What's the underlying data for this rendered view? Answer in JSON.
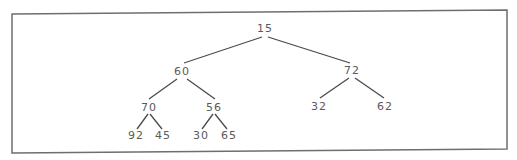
{
  "diagram": {
    "type": "binary-tree",
    "border_color": "#6e6e6e",
    "edge_color": "#4a4a4a",
    "text_color": "#5a5a5a",
    "nodes": [
      {
        "id": "n15",
        "label": "15",
        "x": 265,
        "y": 32
      },
      {
        "id": "n60",
        "label": "60",
        "x": 182,
        "y": 75
      },
      {
        "id": "n72",
        "label": "72",
        "x": 352,
        "y": 74
      },
      {
        "id": "n70",
        "label": "70",
        "x": 149,
        "y": 111
      },
      {
        "id": "n56",
        "label": "56",
        "x": 214,
        "y": 111
      },
      {
        "id": "n32",
        "label": "32",
        "x": 319,
        "y": 110
      },
      {
        "id": "n62",
        "label": "62",
        "x": 385,
        "y": 110
      },
      {
        "id": "n92",
        "label": "92",
        "x": 136,
        "y": 139
      },
      {
        "id": "n45",
        "label": "45",
        "x": 163,
        "y": 139
      },
      {
        "id": "n30",
        "label": "30",
        "x": 201,
        "y": 139
      },
      {
        "id": "n65",
        "label": "65",
        "x": 229,
        "y": 139
      }
    ],
    "edges": [
      {
        "from": "15",
        "to": "60",
        "x1": 262,
        "y1": 37,
        "x2": 184,
        "y2": 63
      },
      {
        "from": "15",
        "to": "72",
        "x1": 268,
        "y1": 37,
        "x2": 350,
        "y2": 63
      },
      {
        "from": "60",
        "to": "70",
        "x1": 177,
        "y1": 79,
        "x2": 149,
        "y2": 99
      },
      {
        "from": "60",
        "to": "56",
        "x1": 187,
        "y1": 79,
        "x2": 215,
        "y2": 99
      },
      {
        "from": "72",
        "to": "32",
        "x1": 349,
        "y1": 78,
        "x2": 320,
        "y2": 98
      },
      {
        "from": "72",
        "to": "62",
        "x1": 355,
        "y1": 78,
        "x2": 384,
        "y2": 98
      },
      {
        "from": "70",
        "to": "92",
        "x1": 148,
        "y1": 114,
        "x2": 137,
        "y2": 129
      },
      {
        "from": "70",
        "to": "45",
        "x1": 150,
        "y1": 114,
        "x2": 162,
        "y2": 129
      },
      {
        "from": "56",
        "to": "30",
        "x1": 213,
        "y1": 114,
        "x2": 202,
        "y2": 129
      },
      {
        "from": "56",
        "to": "65",
        "x1": 215,
        "y1": 114,
        "x2": 227,
        "y2": 129
      }
    ]
  }
}
